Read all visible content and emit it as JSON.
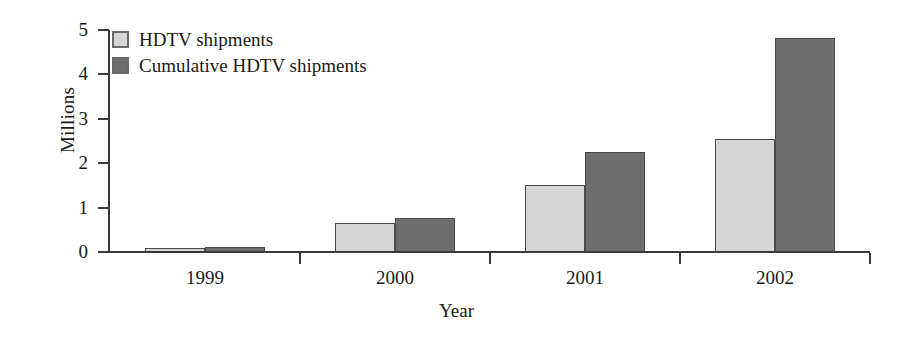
{
  "chart_data": {
    "type": "bar",
    "title": "",
    "subtitle": "",
    "xlabel": "Year",
    "ylabel": "Millions",
    "categories": [
      "1999",
      "2000",
      "2001",
      "2002"
    ],
    "series": [
      {
        "name": "HDTV shipments",
        "color": "#d6d6d6",
        "values": [
          0.1,
          0.65,
          1.5,
          2.55
        ]
      },
      {
        "name": "Cumulative HDTV shipments",
        "color": "#6e6e6e",
        "values": [
          0.12,
          0.77,
          2.25,
          4.83
        ]
      }
    ],
    "ylim": [
      0,
      5
    ],
    "yticks": [
      0,
      1,
      2,
      3,
      4,
      5
    ],
    "ytick_labels": [
      "0",
      "1",
      "2",
      "3",
      "4",
      "5"
    ],
    "grid": false,
    "legend_position": "top-left-inside",
    "axis_color": "#3a3a3a",
    "bar_border_color": "#4a4a4a",
    "background_color": "#ffffff"
  }
}
